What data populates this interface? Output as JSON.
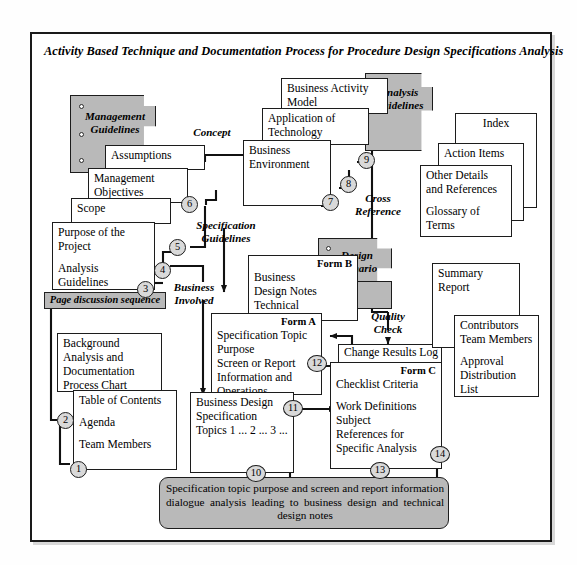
{
  "page": {
    "title": "Activity Based Technique and Documentation Process for Procedure Design Specifications Analysis",
    "accent_gray": "#b9b9b9",
    "line_color": "#1c1c1c",
    "background": "#ffffff"
  },
  "gray_docs": {
    "management_guidelines": "Management\nGuidelines",
    "management_guidelines_l1": "Management",
    "management_guidelines_l2": "Guidelines",
    "analysis_guidelines_l1": "Analysis",
    "analysis_guidelines_l2": "Guidelines",
    "design_scenario_l1": "Design",
    "design_scenario_l2": "Scenario"
  },
  "bars": {
    "page_discussion_sequence": "Page discussion sequence"
  },
  "annotations": {
    "concept": "Concept",
    "specification_guidelines_l1": "Specification",
    "specification_guidelines_l2": "Guidelines",
    "business_involved_l1": "Business",
    "business_involved_l2": "Involved",
    "cross_reference_l1": "Cross",
    "cross_reference_l2": "Reference",
    "quality_check_l1": "Quality",
    "quality_check_l2": "Check"
  },
  "cards": {
    "assumptions": {
      "lines": [
        "Assumptions"
      ]
    },
    "management_objectives": {
      "lines": [
        "Management",
        "Objectives"
      ]
    },
    "scope": {
      "lines": [
        "Scope"
      ]
    },
    "purpose_project": {
      "lines": [
        "Purpose  of  the",
        "Project",
        "",
        "Analysis",
        "Guidelines"
      ]
    },
    "background_analysis": {
      "lines": [
        "Background",
        "Analysis and",
        "Documentation",
        "Process  Chart"
      ]
    },
    "table_of_contents": {
      "lines": [
        "Table  of",
        "Contents",
        "",
        "Agenda",
        "",
        "Team  Members"
      ]
    },
    "business_activity_model": {
      "lines": [
        "Business  Activity",
        "Model"
      ]
    },
    "application_of_technology": {
      "lines": [
        "Application  of",
        "Technology"
      ]
    },
    "business_environment": {
      "lines": [
        "Business",
        "Environment"
      ]
    },
    "index": {
      "lines": [
        "Index"
      ]
    },
    "action_items": {
      "lines": [
        "Action  Items"
      ]
    },
    "other_details": {
      "lines": [
        "Other  Details",
        "and  References",
        "",
        "Glossary  of",
        "Terms"
      ]
    },
    "form_b": {
      "title": "Form B",
      "lines": [
        "Business",
        "Design  Notes",
        "Technical",
        "Design  Notes"
      ]
    },
    "form_a": {
      "title": "Form A",
      "lines": [
        "Specification Topic",
        "Purpose",
        "Screen  or  Report",
        "Information  and",
        "Operations"
      ]
    },
    "business_design_spec": {
      "lines": [
        "Business  Design",
        "Specification",
        "Topics",
        "1 ...",
        "2 ...",
        "3 ..."
      ]
    },
    "change_results_log": {
      "lines": [
        "Change Results Log"
      ]
    },
    "form_c": {
      "title": "Form C",
      "lines": [
        "Checklist  Criteria",
        "",
        "Work  Definitions",
        "Subject",
        "References  for",
        "Specific  Analysis"
      ]
    },
    "summary_report": {
      "lines": [
        "Summary",
        "Report"
      ]
    },
    "contributors": {
      "lines": [
        "Contributors",
        "Team  Members",
        "",
        "Approval",
        "Distribution",
        "List"
      ]
    }
  },
  "summary_box": {
    "text": "Specification topic purpose and screen and report information dialogue analysis leading to business design and technical design notes"
  },
  "steps": {
    "s1": "1",
    "s2": "2",
    "s3": "3",
    "s4": "4",
    "s5": "5",
    "s6": "6",
    "s7": "7",
    "s8": "8",
    "s9": "9",
    "s10": "10",
    "s11": "11",
    "s12": "12",
    "s13": "13",
    "s14": "14"
  }
}
